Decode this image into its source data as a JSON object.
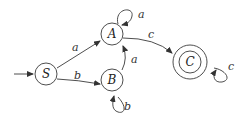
{
  "diagram": {
    "type": "finite-state-automaton",
    "start_state": "S",
    "states": [
      {
        "id": "S",
        "label": "S",
        "accepting": false
      },
      {
        "id": "A",
        "label": "A",
        "accepting": false
      },
      {
        "id": "B",
        "label": "B",
        "accepting": false
      },
      {
        "id": "C",
        "label": "C",
        "accepting": true
      }
    ],
    "transitions": [
      {
        "from": "S",
        "to": "A",
        "label": "a"
      },
      {
        "from": "S",
        "to": "B",
        "label": "b"
      },
      {
        "from": "A",
        "to": "A",
        "label": "a"
      },
      {
        "from": "B",
        "to": "B",
        "label": "b"
      },
      {
        "from": "B",
        "to": "A",
        "label": "a"
      },
      {
        "from": "A",
        "to": "C",
        "label": "c"
      },
      {
        "from": "C",
        "to": "C",
        "label": "c"
      }
    ]
  }
}
